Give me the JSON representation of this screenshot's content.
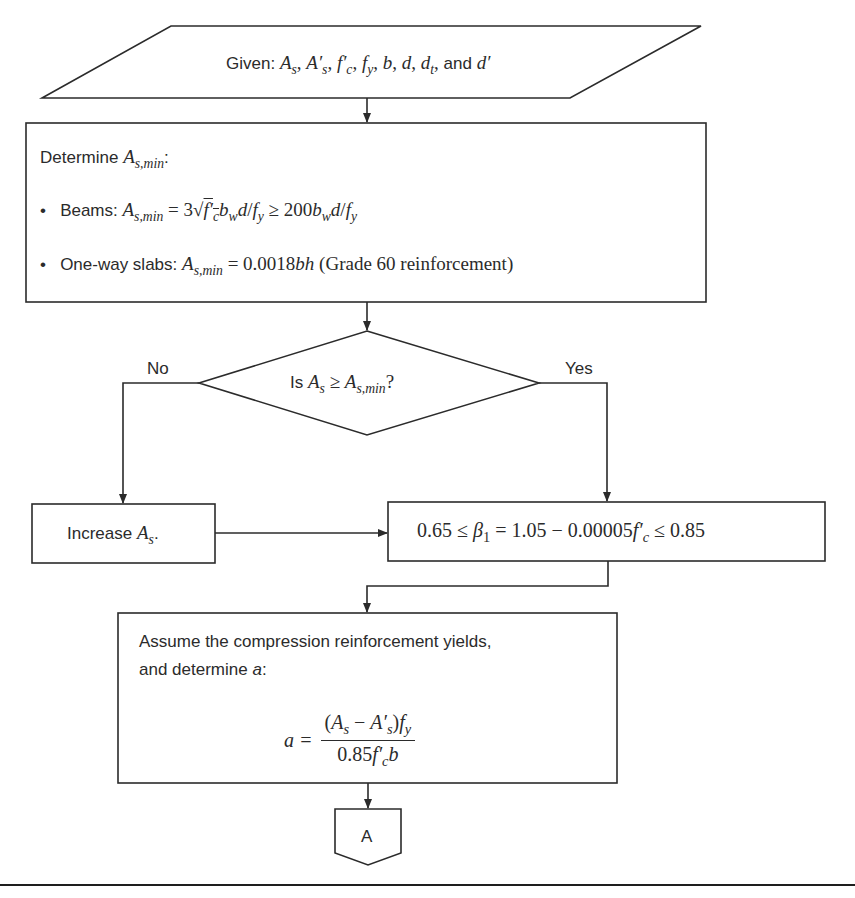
{
  "flowchart": {
    "input": {
      "label": "Given:",
      "math": "A_s, A'_s, f'_c, f_y, b, d, d_t, and d'",
      "display": "Aₛ, A′ₛ, f′꜀, fᵧ, b, d, dₜ, and d′"
    },
    "determine_asmin": {
      "heading_label": "Determine",
      "heading_math": "A_s,min:",
      "bullets": [
        {
          "label": "Beams:",
          "math": "A_s,min = 3√(f'_c) b_w d / f_y ≥ 200 b_w d / f_y"
        },
        {
          "label": "One-way slabs:",
          "math": "A_s,min = 0.0018bh",
          "note": "(Grade 60 reinforcement)"
        }
      ]
    },
    "decision": {
      "label": "Is",
      "math": "A_s ≥ A_s,min?",
      "no_label": "No",
      "yes_label": "Yes"
    },
    "increase": {
      "label": "Increase",
      "math": "A_s."
    },
    "beta": {
      "math": "0.65 ≤ β₁ = 1.05 − 0.00005f'_c ≤ 0.85"
    },
    "assume": {
      "line1": "Assume the compression reinforcement yields,",
      "line2_label": "and determine",
      "line2_math": "a:",
      "equation_lhs": "a =",
      "numerator": "(A_s − A'_s)f_y",
      "denominator": "0.85f'_c b"
    },
    "connector": {
      "label": "A"
    }
  },
  "colors": {
    "stroke": "#2b2b2b",
    "background": "#ffffff",
    "text": "#2b2b2b"
  }
}
